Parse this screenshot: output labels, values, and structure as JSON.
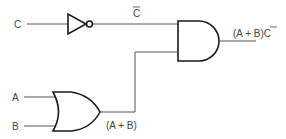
{
  "diagram": {
    "type": "logic-circuit",
    "colors": {
      "background": "#ffffff",
      "wire": "#555555",
      "gate_outline": "#1a1a1a",
      "label": "#444444"
    },
    "inputs": [
      {
        "id": "C",
        "label": "C"
      },
      {
        "id": "A",
        "label": "A"
      },
      {
        "id": "B",
        "label": "B"
      }
    ],
    "gates": [
      {
        "id": "not1",
        "kind": "NOT",
        "inputs": [
          "C"
        ],
        "output_label": "C",
        "output_label_overbar": true
      },
      {
        "id": "or1",
        "kind": "OR",
        "inputs": [
          "A",
          "B"
        ],
        "output_label": "(A + B)"
      },
      {
        "id": "and1",
        "kind": "AND",
        "inputs": [
          "not1",
          "or1"
        ],
        "output_label": "(A + B)C",
        "output_label_overbar_on": "C"
      }
    ],
    "labels": {
      "input_c": "C",
      "input_a": "A",
      "input_b": "B",
      "not_output": "C",
      "or_output": "(A + B)",
      "and_output_prefix": "(A + B)",
      "and_output_suffix": "C"
    }
  }
}
